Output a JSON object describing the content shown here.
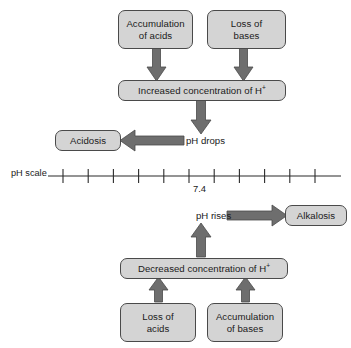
{
  "diagram": {
    "title_text": "",
    "colors": {
      "box_fill": "#d4d4d4",
      "box_stroke": "#4a4a4a",
      "arrow_fill": "#6e6e6e",
      "arrow_stroke": "#4a4a4a",
      "axis_stroke": "#2b2b2b",
      "text": "#1a1a1a",
      "background": "#ffffff"
    },
    "nodes": [
      {
        "id": "accumulation-of-acids",
        "label": "Accumulation\nof acids",
        "x": 118,
        "y": 10,
        "w": 75,
        "h": 39
      },
      {
        "id": "loss-of-bases",
        "label": "Loss of\nbases",
        "x": 207,
        "y": 10,
        "w": 79,
        "h": 39
      },
      {
        "id": "increased-concentration-of-h",
        "label": "Increased concentration of H",
        "superscript": "+",
        "x": 118,
        "y": 80,
        "w": 168,
        "h": 21
      },
      {
        "id": "acidosis",
        "label": "Acidosis",
        "x": 55,
        "y": 130,
        "w": 66,
        "h": 21
      },
      {
        "id": "alkalosis",
        "label": "Alkalosis",
        "x": 285,
        "y": 205,
        "w": 62,
        "h": 21
      },
      {
        "id": "decreased-concentration-of-h",
        "label": "Decreased concentration of H",
        "superscript": "+",
        "x": 120,
        "y": 258,
        "w": 168,
        "h": 21
      },
      {
        "id": "loss-of-acids",
        "label": "Loss of\nacids",
        "x": 120,
        "y": 303,
        "w": 76,
        "h": 39
      },
      {
        "id": "accumulation-of-bases",
        "label": "Accumulation\nof bases",
        "x": 207,
        "y": 303,
        "w": 76,
        "h": 39
      }
    ],
    "edge_labels": [
      {
        "id": "ph-drops",
        "label": "pH drops",
        "x": 186,
        "y": 135
      },
      {
        "id": "ph-rises",
        "label": "pH rises",
        "x": 196,
        "y": 210
      }
    ],
    "ph_scale": {
      "axis_label": "pH scale",
      "axis_label_x": 11,
      "axis_label_y": 168,
      "axis_y": 176,
      "axis_x_start": 48,
      "axis_x_end": 341,
      "tick_count": 11,
      "tick_first_x": 63,
      "tick_spacing": 25.2,
      "tick_half_height": 7,
      "labeled_tick_index": 5,
      "labeled_tick_value": "7.4",
      "labeled_tick_label_x": 193,
      "labeled_tick_label_y": 183
    },
    "arrows": [
      {
        "id": "arrow-acids-to-increased",
        "direction": "down",
        "x": 156,
        "y_from": 47,
        "y_to": 81,
        "shaft_w": 8,
        "head_w": 19,
        "head_len": 14
      },
      {
        "id": "arrow-bases-to-increased",
        "direction": "down",
        "x": 243,
        "y_from": 47,
        "y_to": 81,
        "shaft_w": 8,
        "head_w": 19,
        "head_len": 14
      },
      {
        "id": "arrow-increased-to-ph-drops",
        "direction": "down",
        "x": 201,
        "y_from": 100,
        "y_to": 134,
        "shaft_w": 9,
        "head_w": 20,
        "head_len": 14
      },
      {
        "id": "arrow-ph-drops-to-acidosis",
        "direction": "left",
        "y": 140,
        "x_from": 184,
        "x_to": 120,
        "shaft_w": 9,
        "head_w": 21,
        "head_len": 15
      },
      {
        "id": "arrow-ph-rises-to-alkalosis",
        "direction": "right",
        "y": 215,
        "x_from": 227,
        "x_to": 287,
        "shaft_w": 9,
        "head_w": 21,
        "head_len": 15
      },
      {
        "id": "arrow-decreased-to-ph-rises",
        "direction": "up",
        "x": 201,
        "y_from": 257,
        "y_to": 223,
        "shaft_w": 9,
        "head_w": 20,
        "head_len": 14
      },
      {
        "id": "arrow-loss-acids-to-decreased",
        "direction": "up",
        "x": 158,
        "y_from": 302,
        "y_to": 277,
        "shaft_w": 8,
        "head_w": 19,
        "head_len": 13
      },
      {
        "id": "arrow-accum-bases-to-decreased",
        "direction": "up",
        "x": 245,
        "y_from": 302,
        "y_to": 277,
        "shaft_w": 8,
        "head_w": 19,
        "head_len": 13
      }
    ]
  }
}
